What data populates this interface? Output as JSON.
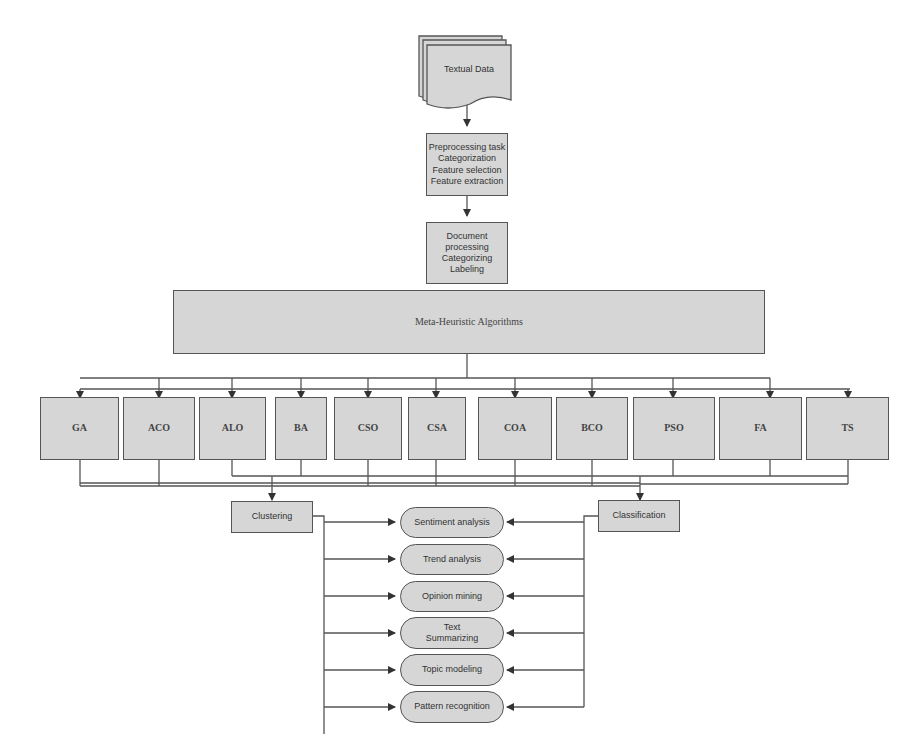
{
  "diagram": {
    "source": {
      "label": "Textual Data",
      "shape": "multi-document"
    },
    "steps": [
      {
        "label": "Preprocessing task\nCategorization\nFeature selection\nFeature extraction"
      },
      {
        "label": "Document\nprocessing\nCategorizing\nLabeling"
      }
    ],
    "meta": {
      "label": "Meta-Heuristic Algorithms"
    },
    "algorithms": [
      {
        "label": "GA"
      },
      {
        "label": "ACO"
      },
      {
        "label": "ALO"
      },
      {
        "label": "BA"
      },
      {
        "label": "CSO"
      },
      {
        "label": "CSA"
      },
      {
        "label": "COA"
      },
      {
        "label": "BCO"
      },
      {
        "label": "PSO"
      },
      {
        "label": "FA"
      },
      {
        "label": "TS"
      }
    ],
    "methods": [
      {
        "label": "Clustering"
      },
      {
        "label": "Classification"
      }
    ],
    "applications": [
      {
        "label": "Sentiment analysis"
      },
      {
        "label": "Trend analysis"
      },
      {
        "label": "Opinion mining"
      },
      {
        "label": "Text\nSummarizing"
      },
      {
        "label": "Topic modeling"
      },
      {
        "label": "Pattern recognition"
      }
    ],
    "colors": {
      "box_fill": "#d6d6d6",
      "line": "#555555",
      "background": "#ffffff"
    }
  }
}
